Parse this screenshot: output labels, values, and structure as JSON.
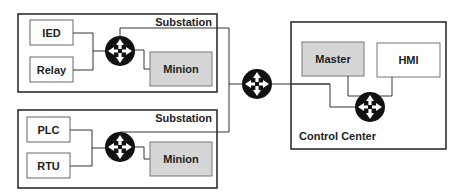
{
  "colors": {
    "line": "#333333",
    "border": "#222222",
    "gray_fill": "#d6d6d6",
    "white_fill": "#ffffff",
    "switch_fill": "#111111"
  },
  "substation_top": {
    "title": "Substation",
    "devices": [
      "IED",
      "Relay"
    ],
    "minion": "Minion"
  },
  "substation_bottom": {
    "title": "Substation",
    "devices": [
      "PLC",
      "RTU"
    ],
    "minion": "Minion"
  },
  "control_center": {
    "title": "Control Center",
    "master": "Master",
    "hmi": "HMI"
  },
  "icons": {
    "switch": "network-switch-icon"
  }
}
